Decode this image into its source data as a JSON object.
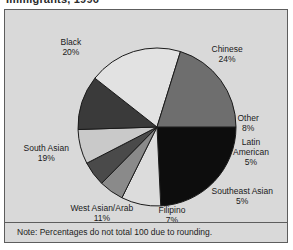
{
  "title": "Immigrants, 1996",
  "note": "Note:  Percentages do not total 100 due to rounding.",
  "colors": {
    "background": "#d9d9d9",
    "frame_border": "#5d5d5d",
    "slice_outline": "#1a1a1a",
    "text": "#1a1a1a"
  },
  "chart_data": {
    "type": "pie",
    "title": "Immigrants, 1996",
    "note": "Note:  Percentages do not total 100 due to rounding.",
    "unit": "%",
    "start_angle_deg": 0,
    "direction": "clockwise",
    "categories": [
      "Chinese",
      "Other",
      "Latin American",
      "Southeast Asian",
      "Filipino",
      "West Asian/Arab",
      "South Asian",
      "Black"
    ],
    "values": [
      24,
      8,
      5,
      5,
      7,
      11,
      19,
      20
    ],
    "slices": [
      {
        "label": "Chinese",
        "value": 24,
        "display": "24%",
        "fill": "#0d0d0d"
      },
      {
        "label": "Other",
        "value": 8,
        "display": "8%",
        "fill": "#dcdcdc"
      },
      {
        "label": "Latin American",
        "value": 5,
        "display": "5%",
        "fill": "#8a8a8a"
      },
      {
        "label": "Southeast Asian",
        "value": 5,
        "display": "5%",
        "fill": "#4a4a4a"
      },
      {
        "label": "Filipino",
        "value": 7,
        "display": "7%",
        "fill": "#c9c9c9"
      },
      {
        "label": "West Asian/Arab",
        "value": 11,
        "display": "11%",
        "fill": "#3a3a3a"
      },
      {
        "label": "South Asian",
        "value": 19,
        "display": "19%",
        "fill": "#e2e2e2"
      },
      {
        "label": "Black",
        "value": 20,
        "display": "20%",
        "fill": "#6e6e6e"
      }
    ],
    "labels": [
      {
        "name": "Chinese",
        "line1": "Chinese",
        "line2": "24%",
        "x": 222,
        "y": 44
      },
      {
        "name": "Other",
        "line1": "Other",
        "line2": "8%",
        "x": 243,
        "y": 113
      },
      {
        "name": "Latin American",
        "line1": "Latin",
        "line2": "American",
        "line3": "5%",
        "x": 246,
        "y": 142
      },
      {
        "name": "Southeast Asian",
        "line1": "Southeast Asian",
        "line2": "5%",
        "x": 237,
        "y": 186
      },
      {
        "name": "Filipino",
        "line1": "Filipino",
        "line2": "7%",
        "x": 167,
        "y": 205
      },
      {
        "name": "West Asian/Arab",
        "line1": "West Asian/Arab",
        "line2": "11%",
        "x": 97,
        "y": 203
      },
      {
        "name": "South Asian",
        "line1": "South Asian",
        "line2": "19%",
        "x": 41,
        "y": 143
      },
      {
        "name": "Black",
        "line1": "Black",
        "line2": "20%",
        "x": 66,
        "y": 37
      }
    ],
    "geometry": {
      "cx": 152,
      "cy": 117,
      "r": 79
    },
    "legend": "none",
    "grid": false
  }
}
